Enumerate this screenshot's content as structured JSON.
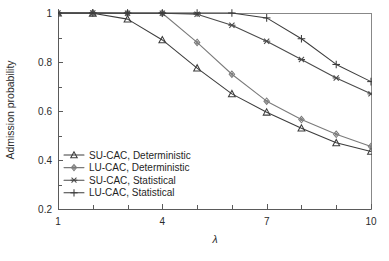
{
  "chart_data": {
    "type": "line",
    "title": "",
    "xlabel": "λ",
    "ylabel": "Admission probability",
    "xlim": [
      1,
      10
    ],
    "ylim": [
      0.2,
      1.0
    ],
    "x": [
      1,
      2,
      3,
      4,
      5,
      6,
      7,
      8,
      9,
      10
    ],
    "xticks": [
      1,
      4,
      7,
      10
    ],
    "xtick_labels": [
      "1",
      "4",
      "7",
      "10"
    ],
    "xminor_ticks": [
      2,
      3,
      5,
      6,
      8,
      9
    ],
    "yticks": [
      0.2,
      0.4,
      0.6,
      0.8,
      1.0
    ],
    "ytick_labels": [
      "0.2",
      "0.4",
      "0.6",
      "0.8",
      "1"
    ],
    "yminor_ticks": [
      0.3,
      0.5,
      0.7,
      0.9
    ],
    "grid": false,
    "legend_position": "lower left",
    "series": [
      {
        "name": "SU-CAC, Deterministic",
        "marker": "triangle-up",
        "color": "#3c3c3c",
        "values": [
          1.0,
          0.999,
          0.975,
          0.89,
          0.775,
          0.67,
          0.595,
          0.53,
          0.47,
          0.435
        ]
      },
      {
        "name": "LU-CAC, Deterministic",
        "marker": "diamond",
        "color": "#7a7a7a",
        "values": [
          1.0,
          1.0,
          0.999,
          0.999,
          0.88,
          0.75,
          0.64,
          0.565,
          0.505,
          0.455
        ]
      },
      {
        "name": "SU-CAC, Statistical",
        "marker": "asterisk",
        "color": "#4a4a4a",
        "values": [
          1.0,
          1.0,
          0.999,
          0.999,
          0.995,
          0.95,
          0.885,
          0.81,
          0.735,
          0.67
        ]
      },
      {
        "name": "LU-CAC, Statistical",
        "marker": "plus",
        "color": "#3c3c3c",
        "values": [
          1.0,
          1.0,
          1.0,
          1.0,
          1.0,
          1.0,
          0.98,
          0.895,
          0.79,
          0.72
        ]
      }
    ]
  },
  "legend": {
    "items": [
      {
        "label": "SU-CAC, Deterministic"
      },
      {
        "label": "LU-CAC, Deterministic"
      },
      {
        "label": "SU-CAC, Statistical"
      },
      {
        "label": "LU-CAC, Statistical"
      }
    ]
  },
  "axes": {
    "y_title": "Admission probability",
    "x_title": "λ"
  }
}
